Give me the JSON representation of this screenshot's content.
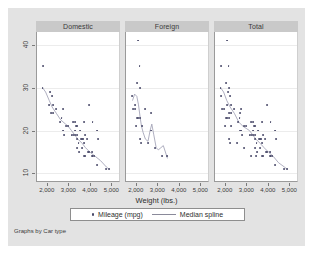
{
  "figure": {
    "note": "Graphs by Car type",
    "legend": {
      "marker_label": "Mileage (mpg)",
      "line_label": "Median spline",
      "marker_icon": "dot-marker-icon",
      "line_icon": "line-sample-icon"
    }
  },
  "chart_data": {
    "type": "scatter",
    "title": "",
    "xlabel": "Weight (lbs.)",
    "ylabel": "",
    "xlim": [
      1500,
      5400
    ],
    "ylim": [
      8,
      43
    ],
    "xticks": [
      2000,
      3000,
      4000,
      5000
    ],
    "xticklabels": [
      "2,000",
      "3,000",
      "4,000",
      "5,000"
    ],
    "yticks": [
      10,
      20,
      30,
      40
    ],
    "yticklabels": [
      "10",
      "20",
      "30",
      "40"
    ],
    "grid": "horizontal",
    "legend_position": "bottom",
    "facet_by": "Car type",
    "panels": [
      {
        "label": "Domestic",
        "points": [
          {
            "x": 4080,
            "y": 22
          },
          {
            "x": 3670,
            "y": 17
          },
          {
            "x": 3690,
            "y": 22
          },
          {
            "x": 3280,
            "y": 20
          },
          {
            "x": 3880,
            "y": 15
          },
          {
            "x": 4330,
            "y": 18
          },
          {
            "x": 3900,
            "y": 26
          },
          {
            "x": 4290,
            "y": 20
          },
          {
            "x": 3350,
            "y": 16
          },
          {
            "x": 3360,
            "y": 19
          },
          {
            "x": 4080,
            "y": 14
          },
          {
            "x": 3720,
            "y": 14
          },
          {
            "x": 3370,
            "y": 21
          },
          {
            "x": 4130,
            "y": 14
          },
          {
            "x": 4060,
            "y": 14
          },
          {
            "x": 3720,
            "y": 19
          },
          {
            "x": 3530,
            "y": 18
          },
          {
            "x": 3105,
            "y": 19
          },
          {
            "x": 3640,
            "y": 18
          },
          {
            "x": 3250,
            "y": 19
          },
          {
            "x": 4290,
            "y": 12
          },
          {
            "x": 3180,
            "y": 22
          },
          {
            "x": 2750,
            "y": 19
          },
          {
            "x": 2200,
            "y": 28
          },
          {
            "x": 2150,
            "y": 24
          },
          {
            "x": 3430,
            "y": 17
          },
          {
            "x": 3260,
            "y": 22
          },
          {
            "x": 3600,
            "y": 18
          },
          {
            "x": 3830,
            "y": 18
          },
          {
            "x": 2690,
            "y": 25
          },
          {
            "x": 2730,
            "y": 20
          },
          {
            "x": 2370,
            "y": 25
          },
          {
            "x": 2930,
            "y": 21
          },
          {
            "x": 3470,
            "y": 15
          },
          {
            "x": 3600,
            "y": 16
          },
          {
            "x": 3490,
            "y": 20
          },
          {
            "x": 3300,
            "y": 21
          },
          {
            "x": 2640,
            "y": 23
          },
          {
            "x": 3700,
            "y": 14
          },
          {
            "x": 3370,
            "y": 18
          },
          {
            "x": 2830,
            "y": 21
          },
          {
            "x": 2120,
            "y": 29
          },
          {
            "x": 1800,
            "y": 35
          },
          {
            "x": 2580,
            "y": 22
          },
          {
            "x": 4720,
            "y": 11
          },
          {
            "x": 4840,
            "y": 11
          },
          {
            "x": 3900,
            "y": 15
          },
          {
            "x": 4060,
            "y": 15
          },
          {
            "x": 2070,
            "y": 26
          },
          {
            "x": 1760,
            "y": 30
          },
          {
            "x": 3170,
            "y": 19
          },
          {
            "x": 2260,
            "y": 24
          },
          {
            "x": 2240,
            "y": 26
          }
        ],
        "spline": [
          [
            1760,
            30
          ],
          [
            1900,
            29
          ],
          [
            2070,
            27
          ],
          [
            2200,
            25.5
          ],
          [
            2400,
            24
          ],
          [
            2600,
            22.5
          ],
          [
            2830,
            21.5
          ],
          [
            2950,
            21
          ],
          [
            3100,
            20
          ],
          [
            3250,
            19
          ],
          [
            3400,
            18
          ],
          [
            3600,
            17
          ],
          [
            3750,
            16
          ],
          [
            3950,
            15
          ],
          [
            4200,
            14
          ],
          [
            4450,
            13
          ],
          [
            4720,
            11.5
          ],
          [
            4840,
            11
          ]
        ]
      },
      {
        "label": "Foreign",
        "points": [
          {
            "x": 2070,
            "y": 41
          },
          {
            "x": 2130,
            "y": 35
          },
          {
            "x": 2020,
            "y": 31
          },
          {
            "x": 2160,
            "y": 30
          },
          {
            "x": 1800,
            "y": 28
          },
          {
            "x": 1830,
            "y": 25
          },
          {
            "x": 1930,
            "y": 25
          },
          {
            "x": 2370,
            "y": 25
          },
          {
            "x": 2020,
            "y": 23
          },
          {
            "x": 2050,
            "y": 23
          },
          {
            "x": 2160,
            "y": 23
          },
          {
            "x": 2650,
            "y": 24
          },
          {
            "x": 1980,
            "y": 21
          },
          {
            "x": 2240,
            "y": 21
          },
          {
            "x": 2670,
            "y": 20
          },
          {
            "x": 2160,
            "y": 18
          },
          {
            "x": 2520,
            "y": 17
          },
          {
            "x": 2200,
            "y": 17
          },
          {
            "x": 3170,
            "y": 14
          },
          {
            "x": 3420,
            "y": 14
          },
          {
            "x": 2830,
            "y": 16
          },
          {
            "x": 1930,
            "y": 26
          }
        ],
        "spline": [
          [
            1800,
            27
          ],
          [
            1900,
            28.5
          ],
          [
            2000,
            28
          ],
          [
            2080,
            26
          ],
          [
            2160,
            23
          ],
          [
            2220,
            21
          ],
          [
            2300,
            19.5
          ],
          [
            2400,
            18
          ],
          [
            2520,
            17.5
          ],
          [
            2620,
            20
          ],
          [
            2700,
            21.5
          ],
          [
            2790,
            19
          ],
          [
            2900,
            16
          ],
          [
            3000,
            15.5
          ],
          [
            3120,
            16
          ],
          [
            3230,
            16.5
          ],
          [
            3330,
            15
          ],
          [
            3420,
            13.5
          ]
        ]
      },
      {
        "label": "Total",
        "points": [
          {
            "x": 2070,
            "y": 41
          },
          {
            "x": 2130,
            "y": 35
          },
          {
            "x": 1800,
            "y": 35
          },
          {
            "x": 2020,
            "y": 31
          },
          {
            "x": 2160,
            "y": 30
          },
          {
            "x": 1760,
            "y": 30
          },
          {
            "x": 2120,
            "y": 29
          },
          {
            "x": 1800,
            "y": 28
          },
          {
            "x": 2200,
            "y": 28
          },
          {
            "x": 1830,
            "y": 25
          },
          {
            "x": 1930,
            "y": 25
          },
          {
            "x": 2370,
            "y": 25
          },
          {
            "x": 2690,
            "y": 25
          },
          {
            "x": 2070,
            "y": 26
          },
          {
            "x": 2240,
            "y": 26
          },
          {
            "x": 3900,
            "y": 26
          },
          {
            "x": 2020,
            "y": 23
          },
          {
            "x": 2050,
            "y": 23
          },
          {
            "x": 2160,
            "y": 23
          },
          {
            "x": 2650,
            "y": 24
          },
          {
            "x": 2640,
            "y": 23
          },
          {
            "x": 2150,
            "y": 24
          },
          {
            "x": 2260,
            "y": 24
          },
          {
            "x": 1980,
            "y": 21
          },
          {
            "x": 2240,
            "y": 21
          },
          {
            "x": 2670,
            "y": 20
          },
          {
            "x": 2830,
            "y": 21
          },
          {
            "x": 2930,
            "y": 21
          },
          {
            "x": 3300,
            "y": 21
          },
          {
            "x": 3370,
            "y": 21
          },
          {
            "x": 2160,
            "y": 18
          },
          {
            "x": 2520,
            "y": 17
          },
          {
            "x": 2200,
            "y": 17
          },
          {
            "x": 2580,
            "y": 22
          },
          {
            "x": 3180,
            "y": 22
          },
          {
            "x": 3260,
            "y": 22
          },
          {
            "x": 4080,
            "y": 22
          },
          {
            "x": 3690,
            "y": 22
          },
          {
            "x": 2750,
            "y": 19
          },
          {
            "x": 2730,
            "y": 20
          },
          {
            "x": 3280,
            "y": 20
          },
          {
            "x": 3490,
            "y": 20
          },
          {
            "x": 3105,
            "y": 19
          },
          {
            "x": 3250,
            "y": 19
          },
          {
            "x": 3170,
            "y": 19
          },
          {
            "x": 3360,
            "y": 19
          },
          {
            "x": 3720,
            "y": 19
          },
          {
            "x": 4290,
            "y": 20
          },
          {
            "x": 3430,
            "y": 17
          },
          {
            "x": 3670,
            "y": 17
          },
          {
            "x": 3530,
            "y": 18
          },
          {
            "x": 3600,
            "y": 18
          },
          {
            "x": 3640,
            "y": 18
          },
          {
            "x": 3830,
            "y": 18
          },
          {
            "x": 3370,
            "y": 18
          },
          {
            "x": 4330,
            "y": 18
          },
          {
            "x": 3350,
            "y": 16
          },
          {
            "x": 3600,
            "y": 16
          },
          {
            "x": 2830,
            "y": 16
          },
          {
            "x": 3470,
            "y": 15
          },
          {
            "x": 3880,
            "y": 15
          },
          {
            "x": 3900,
            "y": 15
          },
          {
            "x": 4060,
            "y": 15
          },
          {
            "x": 3700,
            "y": 14
          },
          {
            "x": 3720,
            "y": 14
          },
          {
            "x": 4080,
            "y": 14
          },
          {
            "x": 4130,
            "y": 14
          },
          {
            "x": 4060,
            "y": 14
          },
          {
            "x": 3170,
            "y": 14
          },
          {
            "x": 3420,
            "y": 14
          },
          {
            "x": 4290,
            "y": 12
          },
          {
            "x": 4720,
            "y": 11
          },
          {
            "x": 4840,
            "y": 11
          }
        ],
        "spline": [
          [
            1760,
            30
          ],
          [
            1900,
            29
          ],
          [
            2050,
            27
          ],
          [
            2200,
            25.5
          ],
          [
            2400,
            24
          ],
          [
            2600,
            22
          ],
          [
            2800,
            21
          ],
          [
            2950,
            20.5
          ],
          [
            3100,
            20
          ],
          [
            3250,
            19
          ],
          [
            3400,
            18
          ],
          [
            3600,
            17
          ],
          [
            3780,
            16
          ],
          [
            3980,
            15
          ],
          [
            4200,
            14
          ],
          [
            4450,
            12.5
          ],
          [
            4720,
            11.5
          ],
          [
            4840,
            11
          ]
        ]
      }
    ]
  }
}
